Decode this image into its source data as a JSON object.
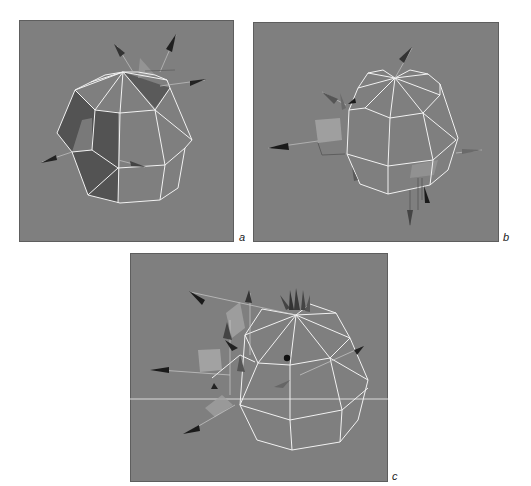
{
  "figure": {
    "background_color": "#7f7f7f",
    "wire_color": "#f2f2f2",
    "panels": [
      {
        "id": "a",
        "label": "a",
        "contents": "wireframe dome with two shaded faces (dark grey) and four cone arrows"
      },
      {
        "id": "b",
        "label": "b",
        "contents": "wireframe dome with small translucent squares and multiple cone arrows"
      },
      {
        "id": "c",
        "label": "c",
        "contents": "wireframe dome with cluster of cone arrows at apex and left side, horizontal ground line"
      }
    ]
  }
}
